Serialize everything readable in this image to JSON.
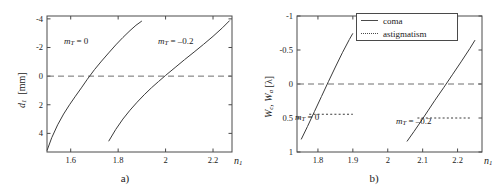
{
  "figure": {
    "panels": [
      {
        "caption": "a)",
        "xlabel_main": "n",
        "xlabel_sub": "1",
        "ylabel_main": "d",
        "ylabel_sub": "1",
        "ylabel_unit": "[mm]",
        "xticks": [
          "1.6",
          "1.8",
          "2",
          "2.2"
        ],
        "yticks": [
          "4",
          "2",
          "0",
          "-2",
          "-4"
        ],
        "annotations": [
          {
            "name": "mt-zero-label",
            "text_main": "m",
            "text_sub": "T",
            "text_rest": " = 0"
          },
          {
            "name": "mt-neg-label",
            "text_main": "m",
            "text_sub": "T",
            "text_rest": " = –0.2"
          }
        ]
      },
      {
        "caption": "b)",
        "xlabel_main": "n",
        "xlabel_sub": "1",
        "ylabel_main": "W",
        "ylabel_sub": "c",
        "ylabel_main2": "W",
        "ylabel_sub2": "a",
        "ylabel_unit": "[λ]",
        "xticks": [
          "1.8",
          "1.9",
          "2",
          "2.1",
          "2.2"
        ],
        "yticks": [
          "1",
          "0.5",
          "0",
          "-0.5",
          "-1"
        ],
        "legend": [
          {
            "label": "coma",
            "style": "solid"
          },
          {
            "label": "astigmatism",
            "style": "dotted"
          }
        ],
        "annotations": [
          {
            "name": "mt-zero-label",
            "text_main": "m",
            "text_sub": "T",
            "text_rest": " = 0"
          },
          {
            "name": "mt-neg-label",
            "text_main": "m",
            "text_sub": "T",
            "text_rest": " = –0.2"
          }
        ]
      }
    ]
  },
  "chart_data": [
    {
      "type": "line",
      "panel": "a)",
      "title": "",
      "xlabel": "n1",
      "ylabel": "d1 [mm]",
      "xlim": [
        1.5,
        2.28
      ],
      "ylim": [
        -5.3,
        4.2
      ],
      "xticks": [
        1.6,
        1.8,
        2.0,
        2.2
      ],
      "yticks": [
        -4,
        -2,
        0,
        2,
        4
      ],
      "grid": false,
      "zero_reference_line": {
        "y": 0,
        "style": "dashed"
      },
      "series": [
        {
          "name": "m_T = 0",
          "style": "solid",
          "x": [
            1.5,
            1.52,
            1.545,
            1.57,
            1.595,
            1.62,
            1.645,
            1.67,
            1.7,
            1.73,
            1.76,
            1.79,
            1.82,
            1.85,
            1.875,
            1.9
          ],
          "y": [
            -5.2,
            -4.3,
            -3.4,
            -2.65,
            -2.0,
            -1.4,
            -0.82,
            -0.22,
            0.45,
            1.05,
            1.62,
            2.18,
            2.7,
            3.18,
            3.55,
            3.85
          ]
        },
        {
          "name": "m_T = -0.2",
          "style": "solid",
          "x": [
            1.76,
            1.79,
            1.82,
            1.85,
            1.88,
            1.91,
            1.94,
            1.97,
            2.0,
            2.04,
            2.08,
            2.12,
            2.16,
            2.2,
            2.24,
            2.27
          ],
          "y": [
            -4.55,
            -3.72,
            -3.0,
            -2.38,
            -1.82,
            -1.3,
            -0.82,
            -0.38,
            0.05,
            0.6,
            1.15,
            1.68,
            2.22,
            2.78,
            3.38,
            3.88
          ]
        }
      ]
    },
    {
      "type": "line",
      "panel": "b)",
      "title": "",
      "xlabel": "n1",
      "ylabel": "Wc , Wa [lambda]",
      "xlim": [
        1.74,
        2.27
      ],
      "ylim": [
        -1.0,
        1.0
      ],
      "xticks": [
        1.8,
        1.9,
        2.0,
        2.1,
        2.2
      ],
      "yticks": [
        -1,
        -0.5,
        0,
        0.5,
        1
      ],
      "grid": false,
      "zero_reference_line": {
        "y": 0,
        "style": "dashed"
      },
      "legend": [
        "coma",
        "astigmatism"
      ],
      "legend_position": "top-center",
      "series": [
        {
          "name": "coma, m_T = 0",
          "style": "solid",
          "x": [
            1.752,
            1.77,
            1.79,
            1.81,
            1.83,
            1.85,
            1.87,
            1.89,
            1.9
          ],
          "y": [
            -0.815,
            -0.625,
            -0.405,
            -0.185,
            0.035,
            0.25,
            0.46,
            0.655,
            0.745
          ]
        },
        {
          "name": "coma, m_T = -0.2",
          "style": "solid",
          "x": [
            2.055,
            2.075,
            2.095,
            2.115,
            2.135,
            2.16,
            2.185,
            2.21,
            2.235,
            2.25
          ],
          "y": [
            -0.845,
            -0.7,
            -0.55,
            -0.395,
            -0.24,
            -0.055,
            0.135,
            0.325,
            0.52,
            0.645
          ]
        },
        {
          "name": "astigmatism, m_T = 0",
          "style": "dotted",
          "x": [
            1.775,
            1.9
          ],
          "y": [
            -0.445,
            -0.445
          ]
        },
        {
          "name": "astigmatism, m_T = -0.2",
          "style": "dotted",
          "x": [
            2.085,
            2.24
          ],
          "y": [
            -0.5,
            -0.5
          ]
        }
      ]
    }
  ]
}
